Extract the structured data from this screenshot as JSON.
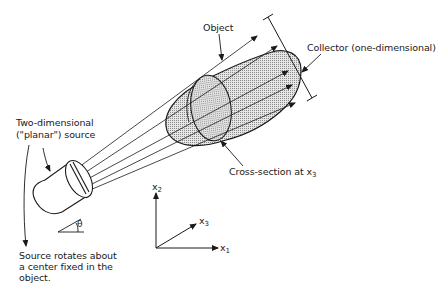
{
  "diagram": {
    "labels": {
      "object": "Object",
      "collector": "Collector (one-dimensional)",
      "source_line1": "Two-dimensional",
      "source_line2": "(\"planar\") source",
      "cross_section": "Cross-section at x",
      "cross_section_sub": "3",
      "theta": "θ",
      "rotation_line1": "Source rotates about",
      "rotation_line2": "a center fixed in the",
      "rotation_line3": "object."
    },
    "axes": {
      "x1": "x",
      "x1_sub": "1",
      "x2": "x",
      "x2_sub": "2",
      "x3": "x",
      "x3_sub": "3"
    },
    "colors": {
      "ink": "#1a1a1a",
      "fill": "#d9d9d9",
      "background": "#ffffff"
    }
  }
}
